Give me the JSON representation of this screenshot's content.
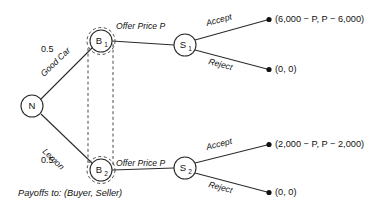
{
  "figure": {
    "type": "game-tree",
    "caption": "Payoffs to: (Buyer, Seller)"
  },
  "nodes": {
    "nature": {
      "label": "N",
      "sub": "",
      "x": 32,
      "y": 106,
      "r": 11
    },
    "buyer_good": {
      "label": "B",
      "sub": "1",
      "x": 101,
      "y": 41,
      "r": 11
    },
    "buyer_lemon": {
      "label": "B",
      "sub": "2",
      "x": 101,
      "y": 170,
      "r": 11
    },
    "seller_good": {
      "label": "S",
      "sub": "1",
      "x": 185,
      "y": 45,
      "r": 11
    },
    "seller_lemon": {
      "label": "S",
      "sub": "2",
      "x": 185,
      "y": 168,
      "r": 11
    }
  },
  "branches": {
    "good_car": {
      "label": "Good Car",
      "probability": "0.5"
    },
    "lemon": {
      "label": "Lemon",
      "probability": "0.5"
    },
    "offer_good": {
      "label": "Offer Price P"
    },
    "offer_lemon": {
      "label": "Offer Price P"
    },
    "accept_good": {
      "label": "Accept"
    },
    "reject_good": {
      "label": "Reject"
    },
    "accept_lemon": {
      "label": "Accept"
    },
    "reject_lemon": {
      "label": "Reject"
    }
  },
  "payoffs": {
    "good_accept": "(6,000 − P, P − 6,000)",
    "good_reject": "(0, 0)",
    "lemon_accept": "(2,000 − P, P − 2,000)",
    "lemon_reject": "(0, 0)"
  },
  "colors": {
    "line": "#2b2b2b",
    "dashed": "#4a4a4a",
    "text": "#111111",
    "background": "#ffffff"
  }
}
